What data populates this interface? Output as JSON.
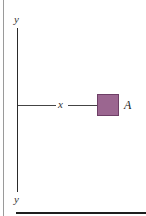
{
  "figure": {
    "axis_label_top": "y",
    "axis_label_bottom": "y",
    "distance_label": "x",
    "area_label": "A",
    "colors": {
      "area_fill": "#9b6690",
      "area_border": "#6e3f66",
      "axis_line": "#2a2a2a"
    }
  }
}
